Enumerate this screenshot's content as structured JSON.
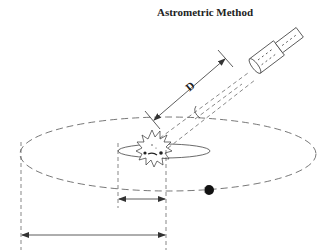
{
  "title": "Astrometric Method",
  "labels": {
    "distance": "D"
  },
  "elements": {
    "star": "star-sunburst",
    "planet": "planet-dot",
    "telescope": "telescope",
    "star_wobble_orbit": "small-ellipse",
    "planet_orbit": "large-dashed-ellipse",
    "star_displacement_arrow": "short-horizontal-arrow",
    "planet_orbit_radius_arrow": "long-horizontal-arrow",
    "angle_arc": "angle-arc"
  },
  "colors": {
    "line": "#444444",
    "background": "#ffffff",
    "planet": "#111111"
  }
}
